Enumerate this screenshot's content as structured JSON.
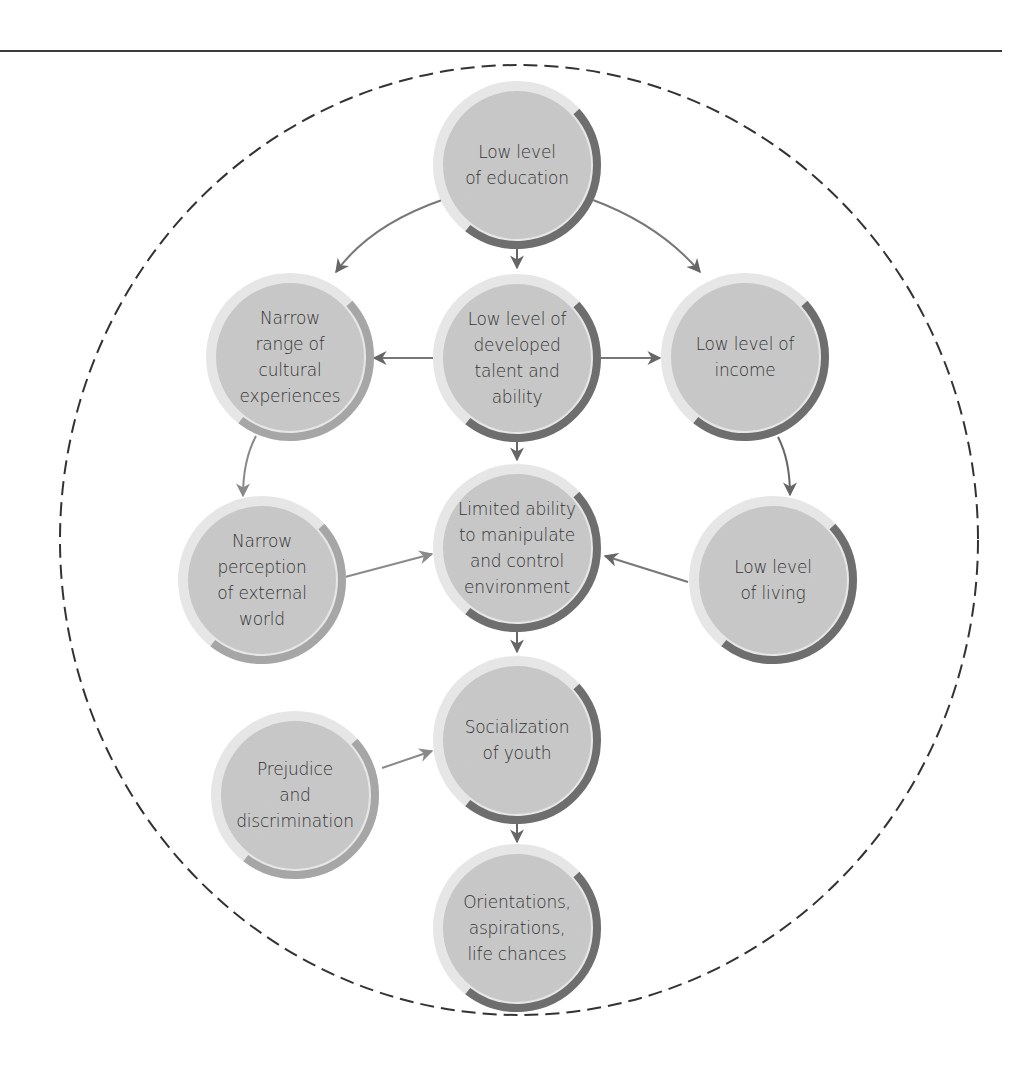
{
  "diagram": {
    "type": "causal-flow",
    "boundary": "dashed-ellipse",
    "colors": {
      "node_fill": "#c8c8c8",
      "node_halo": "#e6e6e6",
      "arc_dark": "#6e6e6e",
      "arc_light": "#a6a6a6",
      "arrow_dark": "#666666",
      "arrow_light": "#8a8a8a",
      "text": "#333333",
      "boundary": "#333333"
    },
    "nodes": [
      {
        "id": "education",
        "lines": [
          "Low level",
          "of education"
        ],
        "x": 517,
        "y": 165,
        "arc": "dark"
      },
      {
        "id": "cultural",
        "lines": [
          "Narrow",
          "range of",
          "cultural",
          "experiences"
        ],
        "x": 290,
        "y": 357,
        "arc": "light"
      },
      {
        "id": "talent",
        "lines": [
          "Low level of",
          "developed",
          "talent and",
          "ability"
        ],
        "x": 517,
        "y": 358,
        "arc": "dark"
      },
      {
        "id": "income",
        "lines": [
          "Low level of",
          "income"
        ],
        "x": 745,
        "y": 357,
        "arc": "dark"
      },
      {
        "id": "perception",
        "lines": [
          "Narrow",
          "perception",
          "of external",
          "world"
        ],
        "x": 262,
        "y": 580,
        "arc": "light"
      },
      {
        "id": "control",
        "lines": [
          "Limited ability",
          "to manipulate",
          "and control",
          "environment"
        ],
        "x": 517,
        "y": 548,
        "arc": "dark"
      },
      {
        "id": "living",
        "lines": [
          "Low level",
          "of living"
        ],
        "x": 773,
        "y": 580,
        "arc": "dark"
      },
      {
        "id": "prejudice",
        "lines": [
          "Prejudice",
          "and",
          "discrimination"
        ],
        "x": 295,
        "y": 795,
        "arc": "light"
      },
      {
        "id": "socialization",
        "lines": [
          "Socialization",
          "of youth"
        ],
        "x": 517,
        "y": 740,
        "arc": "dark"
      },
      {
        "id": "orientations",
        "lines": [
          "Orientations,",
          "aspirations,",
          "life chances"
        ],
        "x": 517,
        "y": 928,
        "arc": "dark"
      }
    ],
    "edges": [
      {
        "from": "education",
        "to": "cultural"
      },
      {
        "from": "education",
        "to": "talent"
      },
      {
        "from": "education",
        "to": "income"
      },
      {
        "from": "talent",
        "to": "cultural"
      },
      {
        "from": "talent",
        "to": "income"
      },
      {
        "from": "talent",
        "to": "control"
      },
      {
        "from": "cultural",
        "to": "perception"
      },
      {
        "from": "income",
        "to": "living"
      },
      {
        "from": "perception",
        "to": "control"
      },
      {
        "from": "living",
        "to": "control"
      },
      {
        "from": "control",
        "to": "socialization"
      },
      {
        "from": "prejudice",
        "to": "socialization"
      },
      {
        "from": "socialization",
        "to": "orientations"
      }
    ]
  },
  "labels": {
    "education": "Low level of education",
    "cultural": "Narrow range of cultural experiences",
    "talent": "Low level of developed talent and ability",
    "income": "Low level of income",
    "perception": "Narrow perception of external world",
    "control": "Limited ability to manipulate and control environment",
    "living": "Low level of living",
    "prejudice": "Prejudice and discrimination",
    "socialization": "Socialization of youth",
    "orientations": "Orientations, aspirations, life chances"
  }
}
